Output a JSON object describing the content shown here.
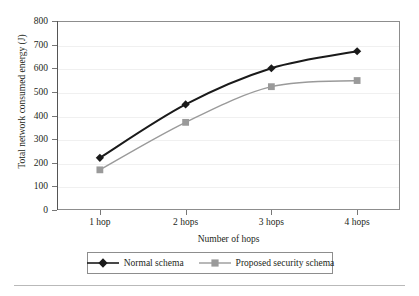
{
  "chart_data": {
    "type": "line",
    "title": "",
    "subtitle": "",
    "xlabel": "Number of hops",
    "ylabel": "Total network consumed energy (J)",
    "categories": [
      "1 hop",
      "2 hops",
      "3 hops",
      "4 hops"
    ],
    "xtick_labels": [
      "1 hop",
      "2 hops",
      "3 hops",
      "4 hops"
    ],
    "ytick_labels": [
      "0",
      "100",
      "200",
      "300",
      "400",
      "500",
      "600",
      "700",
      "800"
    ],
    "yticks": [
      0,
      100,
      200,
      300,
      400,
      500,
      600,
      700,
      800
    ],
    "ylim": [
      0,
      800
    ],
    "xlim": [
      0,
      5
    ],
    "grid": "horizontal-faint",
    "legend_position": "bottom-outside",
    "series": [
      {
        "name": "Normal schema",
        "values": [
          221,
          447,
          600,
          672
        ],
        "color": "#1a1a1a",
        "marker": "diamond",
        "line_width": 2
      },
      {
        "name": "Proposed security schema",
        "values": [
          170,
          371,
          522,
          548
        ],
        "color": "#9a9a9a",
        "marker": "square",
        "line_width": 1.4
      }
    ],
    "annotations": []
  },
  "legend": {
    "entries": [
      {
        "label": "Normal schema",
        "marker": "diamond-marker-icon",
        "color": "#1a1a1a"
      },
      {
        "label": "Proposed security schema",
        "marker": "square-marker-icon",
        "color": "#9a9a9a"
      }
    ]
  },
  "colors": {
    "background": "#ffffff",
    "axis": "#555555",
    "frame": "#8d8d8d",
    "grid": "#f0f0f0",
    "text": "#231f20",
    "series_normal": "#1a1a1a",
    "series_proposed": "#9a9a9a",
    "rule": "#b9b9b9"
  }
}
